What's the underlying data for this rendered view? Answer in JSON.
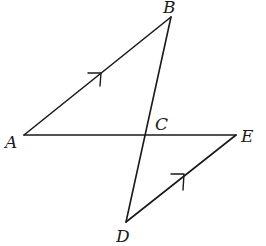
{
  "diagram": {
    "type": "geometry",
    "points": {
      "A": {
        "label": "A",
        "x": 24,
        "y": 135,
        "label_x": 5,
        "label_y": 148
      },
      "B": {
        "label": "B",
        "x": 171,
        "y": 17,
        "label_x": 163,
        "label_y": 13
      },
      "C": {
        "label": "C",
        "x": 145,
        "y": 135,
        "label_x": 155,
        "label_y": 130
      },
      "D": {
        "label": "D",
        "x": 126,
        "y": 222,
        "label_x": 116,
        "label_y": 242
      },
      "E": {
        "label": "E",
        "x": 236,
        "y": 135,
        "label_x": 241,
        "label_y": 142
      }
    },
    "segments": [
      {
        "from": "A",
        "to": "B"
      },
      {
        "from": "B",
        "to": "D"
      },
      {
        "from": "A",
        "to": "E"
      },
      {
        "from": "E",
        "to": "D"
      }
    ],
    "parallel_marks": [
      {
        "segment": "AB",
        "x": 100,
        "y": 74
      },
      {
        "segment": "DE",
        "x": 183,
        "y": 175
      }
    ],
    "relations": [
      "AB ∥ DE",
      "AE and BD intersect at C"
    ],
    "colors": {
      "stroke": "#1a1a1a",
      "background": "#ffffff"
    }
  }
}
